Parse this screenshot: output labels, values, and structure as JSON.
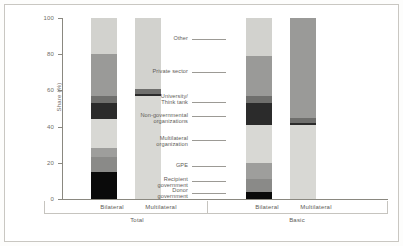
{
  "chart_data": {
    "type": "bar",
    "title": "",
    "subtitle": "",
    "xlabel": "",
    "ylabel": "Share (%)",
    "ylim": [
      0,
      100
    ],
    "yticks": [
      0,
      20,
      40,
      60,
      80,
      100
    ],
    "grid": false,
    "stacked": true,
    "normalized": true,
    "legend_position": "center-right-leader-lines",
    "group_labels": [
      "Total",
      "Basic"
    ],
    "categories": [
      "Bilateral",
      "Multilateral",
      "Bilateral",
      "Multilateral"
    ],
    "series": [
      {
        "name": "Donor government",
        "color": "#0a0a0a",
        "values": [
          15,
          0,
          4,
          0
        ]
      },
      {
        "name": "Recipient government",
        "color": "#8a8a88",
        "values": [
          8,
          0,
          7,
          0
        ]
      },
      {
        "name": "GPE",
        "color": "#9e9e9c",
        "values": [
          5,
          0,
          9,
          0
        ]
      },
      {
        "name": "Multilateral organization",
        "color": "#d8d8d4",
        "values": [
          16,
          57,
          21,
          41
        ]
      },
      {
        "name": "Non-governmental organizations",
        "color": "#2b2b2b",
        "values": [
          9,
          1,
          12,
          1
        ]
      },
      {
        "name": "University/ Think tank",
        "color": "#6f6f6d",
        "values": [
          4,
          3,
          4,
          3
        ]
      },
      {
        "name": "Private sector",
        "color": "#9a9a98",
        "values": [
          23,
          0,
          22,
          55
        ]
      },
      {
        "name": "Other",
        "color": "#d2d2ce",
        "values": [
          20,
          39,
          21,
          0
        ]
      }
    ]
  },
  "legend_labels": {
    "other": "Other",
    "private_sector": "Private sector",
    "university": "University/",
    "think_tank": "Think tank",
    "ngo": "Non-governmental",
    "ngo2": "organizations",
    "multilateral_org": "Multilateral",
    "multilateral_org2": "organization",
    "gpe": "GPE",
    "recipient_gov": "Recipient",
    "recipient_gov2": "government",
    "donor_gov": "Donor",
    "donor_gov2": "government"
  },
  "axis": {
    "y_label": "Share (%)",
    "t0": "0",
    "t20": "20",
    "t40": "40",
    "t60": "60",
    "t80": "80",
    "t100": "100"
  },
  "xaxis": {
    "cat1": "Bilateral",
    "cat2": "Multilateral",
    "cat3": "Bilateral",
    "cat4": "Multilateral",
    "group1": "Total",
    "group2": "Basic"
  }
}
